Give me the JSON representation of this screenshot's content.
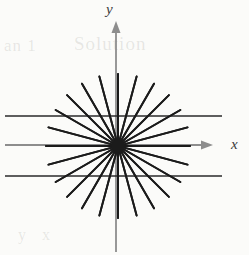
{
  "figure": {
    "background_color": "#fbfbf9",
    "width": 249,
    "height": 255
  },
  "axes": {
    "x_label": "x",
    "y_label": "y",
    "axis_color": "#8d8d8d",
    "origin": {
      "x": 118,
      "y": 146
    },
    "x_axis": {
      "start_x": 5,
      "end_x": 212,
      "y": 145,
      "arrow": "right"
    },
    "y_axis": {
      "x": 116,
      "start_y": 252,
      "end_y": 22,
      "arrow": "up"
    }
  },
  "chart_data": {
    "type": "line",
    "title": "",
    "xlabel": "x",
    "ylabel": "y",
    "grid": false,
    "legend": "none",
    "origin": {
      "x": 118,
      "y": 146
    },
    "ray_color": "#1b1b1b",
    "ray_count": 24,
    "ray_angle_step_deg": 15,
    "ray_radius_px": 72,
    "ray_angles_deg": [
      0,
      15,
      30,
      45,
      60,
      75,
      90,
      105,
      120,
      135,
      150,
      165,
      180,
      195,
      210,
      225,
      240,
      255,
      270,
      285,
      300,
      315,
      330,
      345
    ],
    "center_dot_radius_px": 7,
    "horizontal_lines": [
      {
        "name": "upper-horizontal-line",
        "y": 116,
        "x_start": 5,
        "x_end": 222,
        "color": "#2a2a2a",
        "width": 1.7
      },
      {
        "name": "x-axis-horizontal-line",
        "y": 145,
        "x_start": 5,
        "x_end": 212,
        "color": "#8d8d8d",
        "width": 1.7
      },
      {
        "name": "lower-horizontal-line",
        "y": 176,
        "x_start": 5,
        "x_end": 222,
        "color": "#2a2a2a",
        "width": 1.7
      }
    ],
    "xlim": [
      0,
      249
    ],
    "ylim": [
      0,
      255
    ]
  },
  "bleed_through": {
    "top_left": "an 1",
    "top_right": "Solution",
    "bottom": "y  x"
  }
}
